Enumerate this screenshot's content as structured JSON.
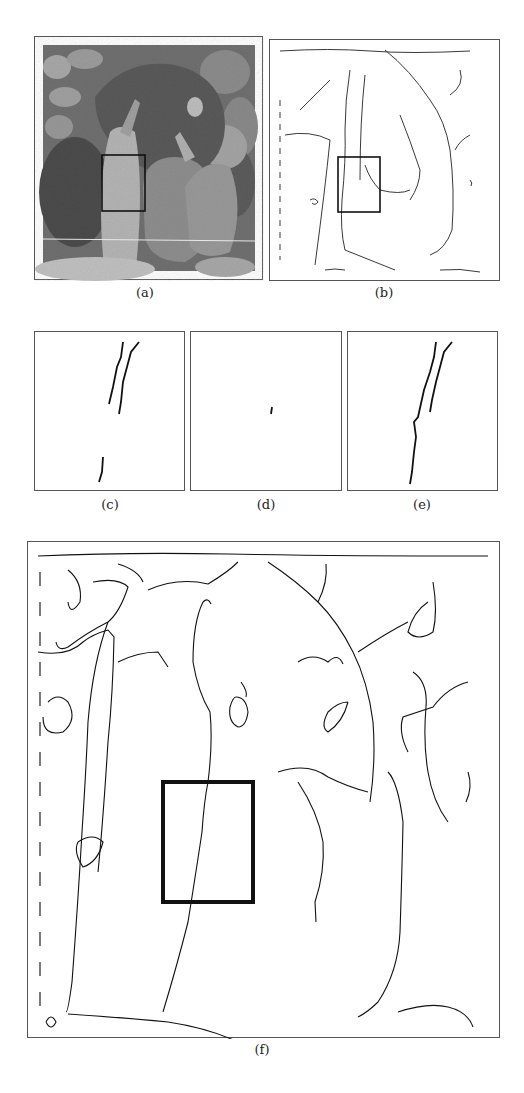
{
  "figure": {
    "panels": [
      {
        "id": "a",
        "label": "(a)",
        "description": "grayscale peppers photo with region box"
      },
      {
        "id": "b",
        "label": "(b)",
        "description": "edge map of peppers with region box"
      },
      {
        "id": "c",
        "label": "(c)",
        "description": "zoomed edge detail, method 1"
      },
      {
        "id": "d",
        "label": "(d)",
        "description": "zoomed edge detail, method 2"
      },
      {
        "id": "e",
        "label": "(e)",
        "description": "zoomed edge detail, method 3"
      },
      {
        "id": "f",
        "label": "(f)",
        "description": "enlarged edge map with region box"
      }
    ]
  },
  "colors": {
    "line": "#111111",
    "frame": "#555555",
    "box": "#111111"
  }
}
